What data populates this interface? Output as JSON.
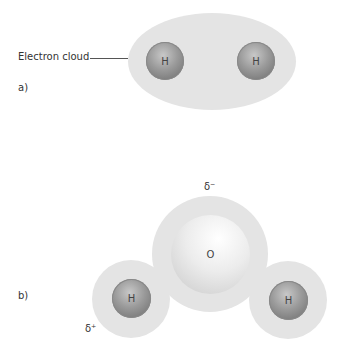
{
  "diagram_a": {
    "label": "a)",
    "cloud_label": "Electron cloud",
    "atoms": [
      {
        "symbol": "H"
      },
      {
        "symbol": "H"
      }
    ]
  },
  "diagram_b": {
    "label": "b)",
    "atoms": [
      {
        "symbol": "O"
      },
      {
        "symbol": "H"
      },
      {
        "symbol": "H"
      }
    ],
    "charges": {
      "oxygen": "δ⁻",
      "hydrogen": "δ⁺"
    }
  },
  "colors": {
    "cloud": "#e4e4e4",
    "hydrogen": "#9a9a9a",
    "oxygen": "#ececec"
  }
}
